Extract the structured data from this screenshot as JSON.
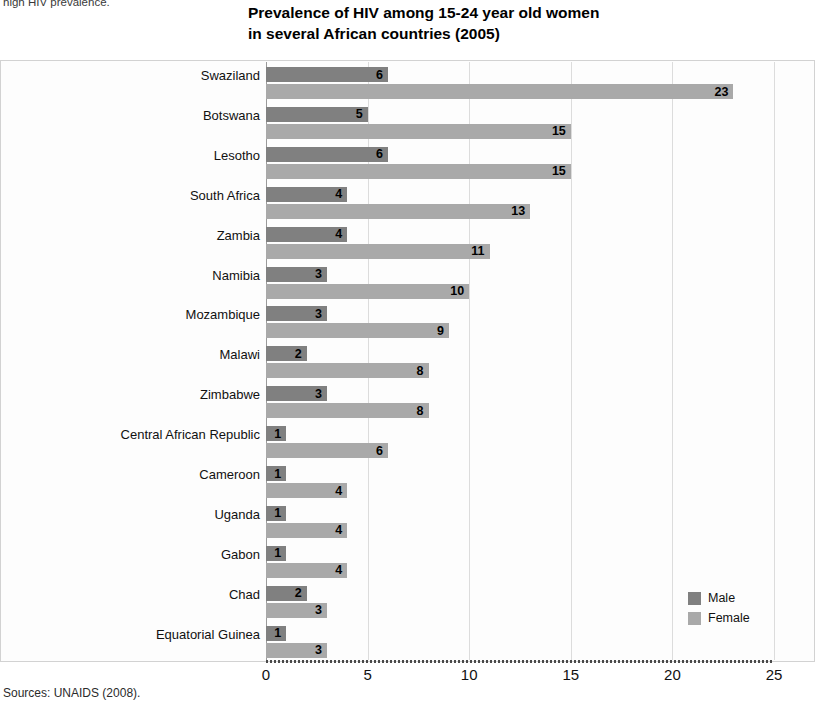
{
  "page": {
    "crop_caption": "high HIV prevalence.",
    "source_note": "Sources: UNAIDS (2008)."
  },
  "title": {
    "line1": "Prevalence of HIV among 15-24 year old women",
    "line2": "in several African countries (2005)"
  },
  "legend": {
    "position": "bottom-right",
    "items": [
      {
        "label": "Male",
        "color": "#808080"
      },
      {
        "label": "Female",
        "color": "#a9a9a9"
      }
    ]
  },
  "axis": {
    "x_ticks": [
      "0",
      "5",
      "10",
      "15",
      "20",
      "25"
    ]
  },
  "chart_data": {
    "type": "bar",
    "orientation": "horizontal",
    "title": "Prevalence of HIV among 15-24 year old women in several African countries (2005)",
    "xlabel": "",
    "ylabel": "",
    "xlim": [
      0,
      25
    ],
    "xticks": [
      0,
      5,
      10,
      15,
      20,
      25
    ],
    "grid": true,
    "legend": [
      "Male",
      "Female"
    ],
    "categories": [
      "Swaziland",
      "Botswana",
      "Lesotho",
      "South Africa",
      "Zambia",
      "Namibia",
      "Mozambique",
      "Malawi",
      "Zimbabwe",
      "Central African Republic",
      "Cameroon",
      "Uganda",
      "Gabon",
      "Chad",
      "Equatorial Guinea"
    ],
    "series": [
      {
        "name": "Male",
        "color": "#808080",
        "values": [
          6,
          5,
          6,
          4,
          4,
          3,
          3,
          2,
          3,
          1,
          1,
          1,
          1,
          2,
          1
        ]
      },
      {
        "name": "Female",
        "color": "#a9a9a9",
        "values": [
          23,
          15,
          15,
          13,
          11,
          10,
          9,
          8,
          8,
          6,
          4,
          4,
          4,
          3,
          3
        ]
      }
    ]
  }
}
